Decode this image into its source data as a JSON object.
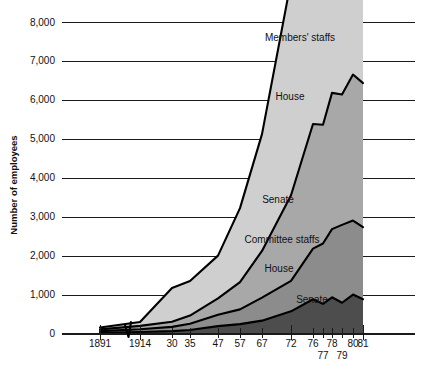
{
  "chart_data": {
    "type": "area",
    "title": "",
    "subtitle": "",
    "xlabel": "",
    "ylabel": "Number of employees",
    "ylim": [
      0,
      8000
    ],
    "ytick_values": [
      0,
      1000,
      2000,
      3000,
      4000,
      5000,
      6000,
      7000,
      8000
    ],
    "ytick_labels": [
      "0",
      "1,000",
      "2,000",
      "3,000",
      "4,000",
      "5,000",
      "6,000",
      "7,000",
      "8,000"
    ],
    "grid": true,
    "grid_axis": "y",
    "legend_position": "inline-annotations",
    "axis_break": {
      "present": true,
      "between": [
        "1891",
        "1914"
      ]
    },
    "x_categories": [
      "1891",
      "1914",
      "30",
      "35",
      "47",
      "57",
      "67",
      "72",
      "76",
      "77",
      "78",
      "79",
      "80",
      "81"
    ],
    "xtick_labels_row1": [
      "1891",
      "1914",
      "30",
      "35",
      "47",
      "57",
      "67",
      "72",
      "76",
      "78",
      "80",
      "81"
    ],
    "xtick_labels_row2": [
      "77",
      "79"
    ],
    "stacking": "stacked-area-cumulative",
    "series": [
      {
        "name": "Committee staffs Senate",
        "group": "Committee staffs",
        "chamber": "Senate",
        "label": "Senate",
        "color": "#4d4d4d",
        "values": [
          20,
          40,
          60,
          90,
          190,
          240,
          330,
          570,
          880,
          760,
          930,
          790,
          1000,
          880
        ]
      },
      {
        "name": "Committee staffs House",
        "group": "Committee staffs",
        "chamber": "House",
        "label": "House",
        "color": "#8c8c8c",
        "values": [
          40,
          70,
          110,
          160,
          290,
          380,
          590,
          780,
          1300,
          1550,
          1750,
          2000,
          1900,
          1850
        ]
      },
      {
        "name": "Members' staffs Senate",
        "group": "Members' staffs",
        "chamber": "Senate",
        "label": "Senate",
        "color": "#a8a8a8",
        "values": [
          45,
          85,
          130,
          210,
          420,
          700,
          1200,
          2200,
          3200,
          3050,
          3500,
          3350,
          3750,
          3700
        ]
      },
      {
        "name": "Members' staffs House",
        "group": "Members' staffs",
        "chamber": "House",
        "label": "House",
        "color": "#cfcfcf",
        "values": [
          50,
          100,
          870,
          890,
          1100,
          1900,
          3000,
          5500,
          6900,
          6950,
          7100,
          7250,
          7400,
          7450
        ]
      }
    ],
    "annotations": [
      {
        "text": "Members' staffs",
        "x": 300,
        "y": 41
      },
      {
        "text": "House",
        "x": 290,
        "y": 100
      },
      {
        "text": "Senate",
        "x": 278,
        "y": 203
      },
      {
        "text": "Committee staffs",
        "x": 282,
        "y": 243
      },
      {
        "text": "House",
        "x": 279,
        "y": 272
      },
      {
        "text": "Senate",
        "x": 312,
        "y": 303
      }
    ]
  }
}
